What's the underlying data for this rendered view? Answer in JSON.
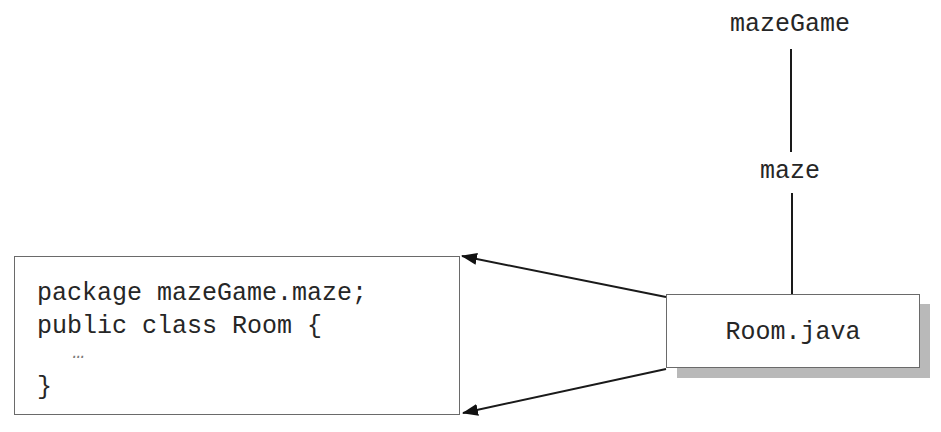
{
  "diagram": {
    "package_tree": {
      "root": "mazeGame",
      "child": "maze"
    },
    "file": {
      "name": "Room.java"
    },
    "source_code": {
      "lines": [
        "package mazeGame.maze;",
        "public class Room {",
        "   …",
        "}"
      ]
    },
    "connectors": [
      {
        "from": "package-mazeGame",
        "to": "package-maze",
        "type": "line"
      },
      {
        "from": "package-maze",
        "to": "file-Room.java",
        "type": "line"
      },
      {
        "from": "file-Room.java",
        "to": "code-box-top-right",
        "type": "arrow"
      },
      {
        "from": "file-Room.java",
        "to": "code-box-bottom-right",
        "type": "arrow"
      }
    ],
    "colors": {
      "line": "#1a1a1a",
      "box_border": "#6a6a6a",
      "shadow": "#b9b9b9",
      "text": "#262626",
      "background": "#ffffff"
    }
  }
}
